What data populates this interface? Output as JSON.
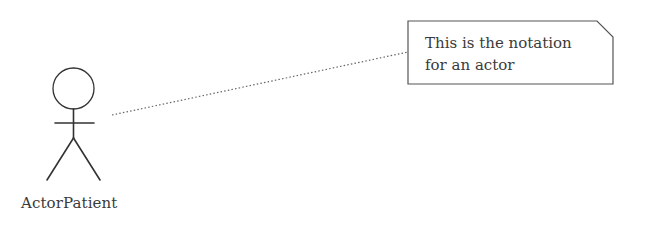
{
  "diagram": {
    "type": "uml-use-case",
    "actor": {
      "name": "ActorPatient",
      "head": {
        "cx": 73.5,
        "cy": 88.5,
        "r": 20.5
      },
      "body": {
        "x": 73.5,
        "y1": 109,
        "y2": 138
      },
      "arms": {
        "x1": 55,
        "x2": 94,
        "y": 123
      },
      "legs": [
        {
          "x1": 73.5,
          "y1": 138,
          "x2": 47,
          "y2": 180
        },
        {
          "x1": 73.5,
          "y1": 138,
          "x2": 100,
          "y2": 180
        }
      ]
    },
    "note": {
      "lines": [
        "This is the notation",
        "for an actor"
      ],
      "box": {
        "left": 408,
        "top": 21,
        "right": 613,
        "bottom": 84,
        "fold": 16
      }
    },
    "connector": {
      "style": "dotted",
      "from": {
        "x": 112,
        "y": 115
      },
      "to": {
        "x": 408,
        "y": 52
      }
    },
    "colors": {
      "stroke": "#333333",
      "note_stroke": "#555555",
      "connector": "#666666",
      "text": "#3a3a3a",
      "background": "#ffffff"
    }
  }
}
